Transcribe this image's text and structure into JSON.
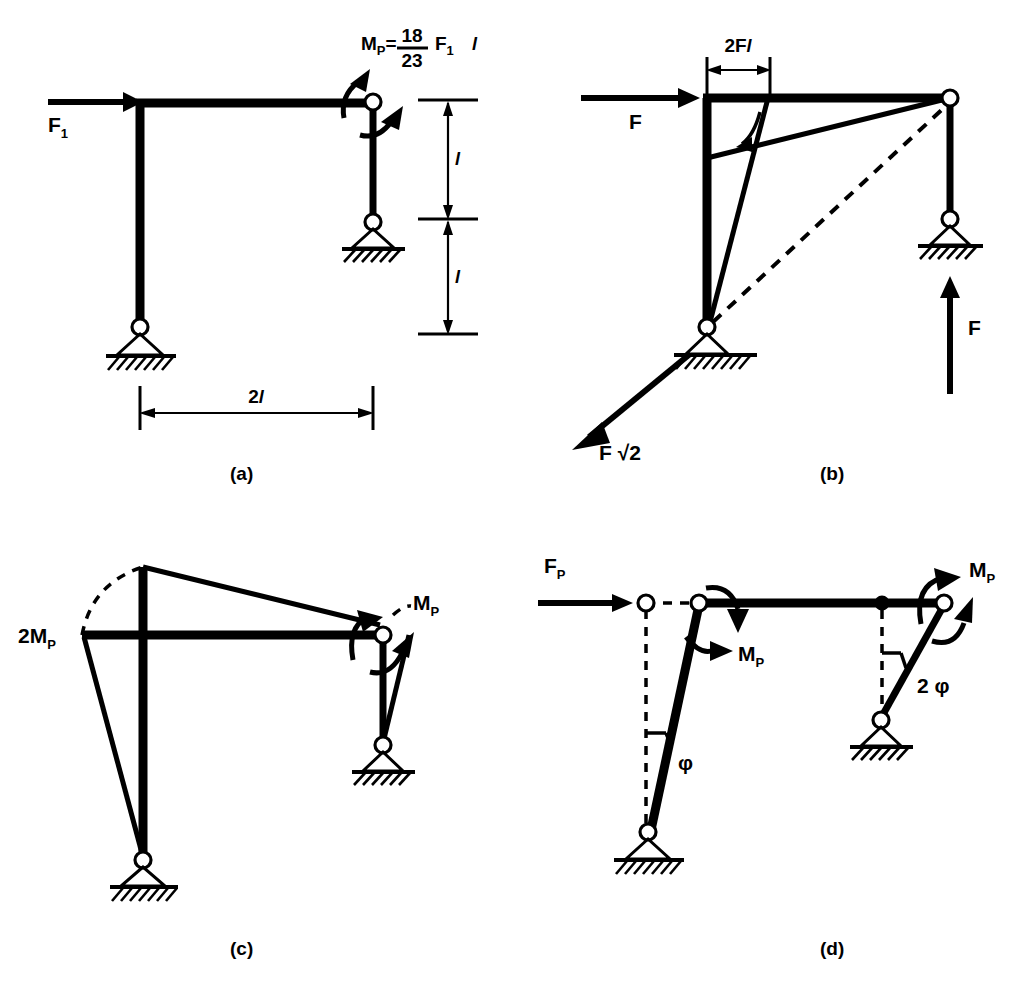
{
  "figure": {
    "type": "structural-engineering-diagram",
    "background_color": "#ffffff",
    "ink_color": "#000000"
  },
  "panels": [
    {
      "id": "a",
      "caption": "(a)",
      "description": "Portal frame with applied horizontal force and required plastic moment",
      "labels": {
        "applied_force": "F",
        "applied_force_sub": "1",
        "moment_lead": "M",
        "moment_lead_sub": "P",
        "moment_equals": "=",
        "frac_numerator": "18",
        "frac_denominator": "23",
        "moment_tail": "F",
        "moment_tail_sub": "1",
        "moment_tail_len": "l",
        "height_upper": "l",
        "height_lower": "l",
        "span": "2l"
      }
    },
    {
      "id": "b",
      "caption": "(b)",
      "description": "Free body with bending moment diagram, reactions F and F root 2",
      "labels": {
        "applied_force": "F",
        "moment_dim": "2Fl",
        "reaction_vertical": "F",
        "reaction_diagonal": "F √2"
      }
    },
    {
      "id": "c",
      "caption": "(c)",
      "description": "Bending moment diagram at collapse showing plastic hinge moments",
      "labels": {
        "left_moment": "2M",
        "left_moment_sub": "P",
        "right_moment": "M",
        "right_moment_sub": "P"
      }
    },
    {
      "id": "d",
      "caption": "(d)",
      "description": "Collapse mechanism with virtual rotations",
      "labels": {
        "collapse_force": "F",
        "collapse_force_sub": "P",
        "left_moment": "M",
        "left_moment_sub": "P",
        "right_moment": "M",
        "right_moment_sub": "P",
        "left_rotation": "φ",
        "right_rotation": "2 φ"
      }
    }
  ]
}
